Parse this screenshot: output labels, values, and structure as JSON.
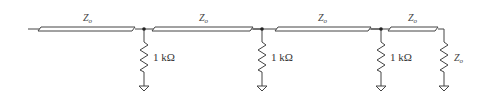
{
  "diagram": {
    "type": "circuit-schematic",
    "transmission_lines": [
      {
        "label": "Z",
        "sub": "o"
      },
      {
        "label": "Z",
        "sub": "o"
      },
      {
        "label": "Z",
        "sub": "o"
      },
      {
        "label": "Z",
        "sub": "o"
      }
    ],
    "shunt_resistors": [
      {
        "label": "1 kΩ"
      },
      {
        "label": "1 kΩ"
      },
      {
        "label": "1 kΩ"
      }
    ],
    "termination": {
      "label": "Z",
      "sub": "o"
    },
    "colors": {
      "line": "#444444",
      "background": "#ffffff"
    }
  }
}
